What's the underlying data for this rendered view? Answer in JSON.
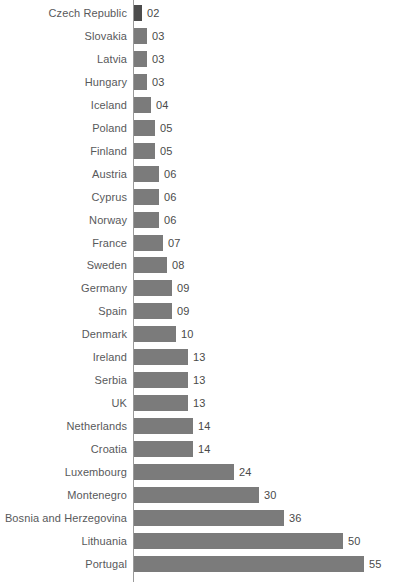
{
  "chart_data": {
    "type": "bar",
    "orientation": "horizontal",
    "title": "",
    "subtitle": "",
    "xlabel": "",
    "ylabel": "",
    "grid": false,
    "legend": null,
    "axis": {
      "value_axis_visible_line": true,
      "value_axis_ticks": [],
      "xlim": [
        0,
        55
      ]
    },
    "colors": {
      "bar": "#7b7b7b",
      "bar_highlight": "#4c4c4c",
      "category_label": "#58595b",
      "value_label": "#4a4a4a",
      "axis_line": "#9a9a9a",
      "background": "#ffffff"
    },
    "highlight_category": "Czech Republic",
    "categories": [
      "Czech Republic",
      "Slovakia",
      "Latvia",
      "Hungary",
      "Iceland",
      "Poland",
      "Finland",
      "Austria",
      "Cyprus",
      "Norway",
      "France",
      "Sweden",
      "Germany",
      "Spain",
      "Denmark",
      "Ireland",
      "Serbia",
      "UK",
      "Netherlands",
      "Croatia",
      "Luxembourg",
      "Montenegro",
      "Bosnia and Herzegovina",
      "Lithuania",
      "Portugal"
    ],
    "values": [
      2,
      3,
      3,
      3,
      4,
      5,
      5,
      6,
      6,
      6,
      7,
      8,
      9,
      9,
      10,
      13,
      13,
      13,
      14,
      14,
      24,
      30,
      36,
      50,
      55
    ],
    "value_labels": [
      "02",
      "03",
      "03",
      "03",
      "04",
      "05",
      "05",
      "06",
      "06",
      "06",
      "07",
      "08",
      "09",
      "09",
      "10",
      "13",
      "13",
      "13",
      "14",
      "14",
      "24",
      "30",
      "36",
      "50",
      "55"
    ]
  }
}
